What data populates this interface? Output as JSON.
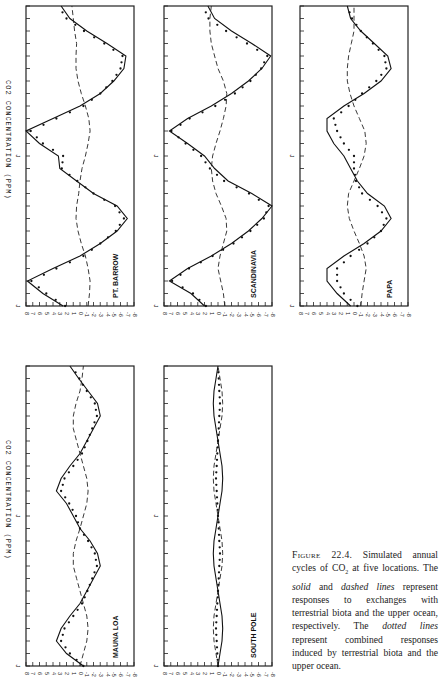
{
  "figure": {
    "caption": {
      "label": "Figure 22.4.",
      "parts": [
        {
          "text": " Simulated annual cycles of CO",
          "style": "normal"
        },
        {
          "text": "2",
          "style": "sub"
        },
        {
          "text": " at five locations. The ",
          "style": "normal"
        },
        {
          "text": "solid",
          "style": "italic"
        },
        {
          "text": " and ",
          "style": "normal"
        },
        {
          "text": "dashed lines",
          "style": "italic"
        },
        {
          "text": " represent responses to exchanges with terrestrial biota and the upper ocean, respectively. The ",
          "style": "normal"
        },
        {
          "text": "dotted lines",
          "style": "italic"
        },
        {
          "text": " represent combined responses induced by terrestrial biota and the upper ocean.",
          "style": "normal"
        }
      ]
    },
    "y_axis_label": "CO2 CONCENTRATION (PPM)",
    "x_tick_label": "J"
  },
  "chart_data": [
    {
      "type": "line",
      "title": "PT. BARROW",
      "xlabel": "month",
      "ylabel": "CO2 CONCENTRATION (PPM)",
      "ylim": [
        -8,
        8
      ],
      "yticks": [
        "8",
        "7",
        "6",
        "5",
        "4",
        "3",
        "2",
        "1",
        "0",
        "-1",
        "-2",
        "-3",
        "-4",
        "-5",
        "-6",
        "-7",
        "-8"
      ],
      "xticks": [
        "J",
        "J"
      ],
      "x": [
        0,
        1,
        2,
        3,
        4,
        5,
        6,
        7,
        8,
        9,
        10,
        11,
        12,
        13,
        14,
        15,
        16,
        17,
        18,
        19,
        20,
        21,
        22,
        23,
        24
      ],
      "series": [
        {
          "name": "terrestrial biota (solid)",
          "values": [
            2.5,
            5.5,
            7.8,
            4,
            0,
            -3,
            -5.5,
            -7,
            -5.5,
            -2,
            0.5,
            3,
            3.2,
            6,
            8,
            4,
            0,
            -3,
            -5,
            -6.5,
            -6.8,
            -4,
            -1,
            1.5,
            2.8
          ]
        },
        {
          "name": "upper ocean (dashed)",
          "values": [
            -1.2,
            -1.4,
            -1.5,
            -1.2,
            -0.8,
            -0.2,
            0.3,
            0.6,
            0.5,
            0.2,
            0,
            -0.3,
            -0.8,
            -1.2,
            -1.5,
            -1.3,
            -0.8,
            -0.2,
            0.3,
            0.6,
            0.6,
            0.5,
            0.8,
            1,
            1.2
          ]
        },
        {
          "name": "combined (dotted)",
          "values": [
            2.2,
            5,
            7.2,
            3.5,
            -0.5,
            -3,
            -5.3,
            -6.5,
            -5.2,
            -2,
            0.4,
            2.7,
            2.5,
            5.5,
            7.3,
            3.5,
            -0.5,
            -3,
            -4.8,
            -6,
            -6.3,
            -3.6,
            -0.6,
            2,
            3.2
          ]
        }
      ]
    },
    {
      "type": "line",
      "title": "SCANDINAVIA",
      "xlabel": "month",
      "ylabel": "CO2 CONCENTRATION (PPM)",
      "ylim": [
        -8,
        8
      ],
      "yticks": [
        "8",
        "7",
        "6",
        "5",
        "4",
        "3",
        "2",
        "1",
        "0",
        "-1",
        "-2",
        "-3",
        "-4",
        "-5",
        "-6",
        "-7",
        "-8"
      ],
      "xticks": [
        "J",
        "J"
      ],
      "x": [
        0,
        1,
        2,
        3,
        4,
        5,
        6,
        7,
        8,
        9,
        10,
        11,
        12,
        13,
        14,
        15,
        16,
        17,
        18,
        19,
        20,
        21,
        22,
        23,
        24
      ],
      "series": [
        {
          "name": "terrestrial biota (solid)",
          "values": [
            2,
            4,
            7.2,
            4.5,
            1,
            -2,
            -4.5,
            -6.5,
            -8,
            -5,
            -1.5,
            0.5,
            2,
            4.5,
            7.2,
            4.5,
            1,
            -2,
            -4.5,
            -6.5,
            -7.8,
            -5,
            -2,
            0.5,
            1.5
          ]
        },
        {
          "name": "upper ocean (dashed)",
          "values": [
            -1,
            -0.8,
            -0.4,
            0,
            -0.3,
            -0.8,
            -1.3,
            -1.2,
            -0.5,
            0.3,
            0.8,
            1,
            0.8,
            0.3,
            -0.3,
            -0.8,
            -1.2,
            -1.3,
            -0.8,
            0,
            0.5,
            1,
            1.2,
            1.2,
            1
          ]
        },
        {
          "name": "combined (dotted)",
          "values": [
            1.8,
            3.7,
            6.8,
            4.3,
            0.8,
            -2.3,
            -4.8,
            -6.8,
            -7.5,
            -4.6,
            -0.9,
            1.2,
            2.5,
            4.8,
            6.9,
            4.2,
            0.4,
            -2.5,
            -4.8,
            -6.4,
            -7.3,
            -4.3,
            -1.2,
            1.4,
            2.2
          ]
        }
      ]
    },
    {
      "type": "line",
      "title": "PAPA",
      "xlabel": "month",
      "ylabel": "CO2 CONCENTRATION (PPM)",
      "ylim": [
        -8,
        8
      ],
      "yticks": [
        "8",
        "7",
        "6",
        "5",
        "4",
        "3",
        "2",
        "1",
        "0",
        "-1",
        "-2",
        "-3",
        "-4",
        "-5",
        "-6",
        "-7",
        "-8"
      ],
      "xticks": [
        "J",
        "J"
      ],
      "x": [
        0,
        1,
        2,
        3,
        4,
        5,
        6,
        7,
        8,
        9,
        10,
        11,
        12,
        13,
        14,
        15,
        16,
        17,
        18,
        19,
        20,
        21,
        22,
        23,
        24
      ],
      "series": [
        {
          "name": "terrestrial biota (solid)",
          "values": [
            0.5,
            2.5,
            4,
            4,
            1.5,
            -1.5,
            -4,
            -5.5,
            -4.5,
            -2,
            -0.5,
            0.5,
            1.5,
            3,
            4,
            4,
            1.5,
            -1.5,
            -4,
            -5.5,
            -5,
            -3,
            -1,
            0.5,
            1
          ]
        },
        {
          "name": "upper ocean (dashed)",
          "values": [
            -1,
            -1.2,
            -1.5,
            -1.8,
            -1.5,
            -0.8,
            0,
            0.7,
            1,
            0.8,
            0,
            -0.8,
            -1.5,
            -1.8,
            -1.6,
            -0.8,
            0,
            0.6,
            1,
            1,
            0.8,
            0.4,
            0,
            0,
            0
          ]
        },
        {
          "name": "combined (dotted)",
          "values": [
            -0.5,
            1.5,
            2.5,
            2.5,
            0.5,
            -2,
            -4,
            -4.8,
            -3.5,
            -1.2,
            -0.3,
            0,
            0,
            1.5,
            2.5,
            3,
            0.8,
            -1.2,
            -3.3,
            -4.8,
            -4.5,
            -2.8,
            -1,
            0.3,
            1
          ]
        }
      ]
    },
    {
      "type": "line",
      "title": "MAUNA LOA",
      "xlabel": "month",
      "ylabel": "CO2 CONCENTRATION (PPM)",
      "ylim": [
        -8,
        8
      ],
      "yticks": [
        "8",
        "7",
        "6",
        "5",
        "4",
        "3",
        "2",
        "1",
        "0",
        "-1",
        "-2",
        "-3",
        "-4",
        "-5",
        "-6",
        "-7",
        "-8"
      ],
      "xticks": [
        "J",
        "J"
      ],
      "x": [
        0,
        1,
        2,
        3,
        4,
        5,
        6,
        7,
        8,
        9,
        10,
        11,
        12,
        13,
        14,
        15,
        16,
        17,
        18,
        19,
        20,
        21,
        22,
        23,
        24
      ],
      "series": [
        {
          "name": "terrestrial biota (solid)",
          "values": [
            -0.5,
            2,
            3.5,
            2.8,
            1.5,
            0,
            -1,
            -2,
            -3,
            -2.6,
            -1.5,
            0,
            1,
            2,
            3.5,
            2.8,
            1.5,
            0,
            -1,
            -2,
            -3,
            -2.6,
            -1.2,
            0.2,
            1.5
          ]
        },
        {
          "name": "upper ocean (dashed)",
          "values": [
            0,
            -0.5,
            -1,
            -1.2,
            -1,
            -0.5,
            0,
            0.5,
            1,
            1,
            0.6,
            0,
            -0.5,
            -1,
            -1.2,
            -1,
            -0.5,
            0,
            0.5,
            1,
            1,
            0.6,
            0,
            -0.3,
            -0.5
          ]
        },
        {
          "name": "combined (dotted)",
          "values": [
            -0.5,
            1.5,
            2.8,
            2.3,
            1,
            -0.3,
            -1.1,
            -1.8,
            -2.5,
            -2.2,
            -1.2,
            0,
            0.6,
            1.6,
            2.8,
            2.3,
            1,
            -0.3,
            -1.1,
            -1.8,
            -2.5,
            -2.2,
            -1,
            0.1,
            1.2
          ]
        }
      ]
    },
    {
      "type": "line",
      "title": "SOUTH POLE",
      "xlabel": "month",
      "ylabel": "CO2 CONCENTRATION (PPM)",
      "ylim": [
        -8,
        8
      ],
      "yticks": [
        "8",
        "7",
        "6",
        "5",
        "4",
        "3",
        "2",
        "1",
        "0",
        "-1",
        "-2",
        "-3",
        "-4",
        "-5",
        "-6",
        "-7",
        "-8"
      ],
      "xticks": [
        "J",
        "J"
      ],
      "x": [
        0,
        1,
        2,
        3,
        4,
        5,
        6,
        7,
        8,
        9,
        10,
        11,
        12,
        13,
        14,
        15,
        16,
        17,
        18,
        19,
        20,
        21,
        22,
        23,
        24
      ],
      "series": [
        {
          "name": "terrestrial biota (solid)",
          "values": [
            0,
            -0.3,
            -0.6,
            -0.7,
            -0.6,
            -0.3,
            0,
            0.3,
            0.6,
            0.7,
            0.6,
            0.3,
            0,
            -0.3,
            -0.6,
            -0.7,
            -0.6,
            -0.3,
            0,
            0.3,
            0.6,
            0.7,
            0.6,
            0.3,
            0
          ]
        },
        {
          "name": "upper ocean (dashed)",
          "values": [
            0,
            0.3,
            0.6,
            0.7,
            0.6,
            0.3,
            0,
            -0.3,
            -0.6,
            -0.7,
            -0.6,
            -0.3,
            0,
            0.3,
            0.6,
            0.7,
            0.6,
            0.3,
            0,
            -0.3,
            -0.6,
            -0.7,
            -0.6,
            -0.3,
            0
          ]
        },
        {
          "name": "combined (dotted)",
          "values": [
            0,
            0.1,
            0.2,
            0.3,
            0.2,
            0.1,
            0,
            -0.1,
            -0.2,
            -0.3,
            -0.2,
            -0.1,
            0,
            0.1,
            0.2,
            0.3,
            0.2,
            0.1,
            0,
            -0.1,
            -0.2,
            -0.3,
            -0.2,
            -0.1,
            0
          ]
        }
      ]
    }
  ]
}
